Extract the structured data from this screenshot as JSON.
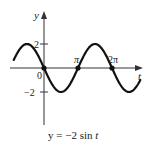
{
  "chart_data": {
    "type": "line",
    "title": "",
    "caption": "y = −2 sin t",
    "xlabel": "t",
    "ylabel": "y",
    "function": "y = -2 sin t",
    "x_ticks": [
      {
        "value": 0,
        "label": "0"
      },
      {
        "value": 3.14159,
        "label": "π"
      },
      {
        "value": 6.28319,
        "label": "2π"
      }
    ],
    "y_ticks": [
      {
        "value": 2,
        "label": "2"
      },
      {
        "value": -2,
        "label": "−2"
      }
    ],
    "xlim": [
      -3.1,
      9.0
    ],
    "ylim": [
      -4.8,
      4.7
    ],
    "grid": false,
    "legend": null,
    "marked_points": [
      {
        "x": 0,
        "y": 0
      },
      {
        "x": 3.14159,
        "y": 0
      },
      {
        "x": 6.28319,
        "y": 0
      }
    ],
    "series": [
      {
        "name": "y = -2 sin t",
        "x": [
          -2.8,
          -2.356,
          -1.571,
          -0.785,
          0,
          0.785,
          1.571,
          2.356,
          3.142,
          3.927,
          4.712,
          5.498,
          6.283,
          7.069,
          7.854,
          8.639,
          8.9
        ],
        "values": [
          0.67,
          1.41,
          2.0,
          1.41,
          0,
          -1.41,
          -2.0,
          -1.41,
          0,
          1.41,
          2.0,
          1.41,
          0,
          -1.41,
          -2.0,
          -1.41,
          -1.0
        ]
      }
    ],
    "t_range": [
      -2.8,
      8.9
    ],
    "amplitude": 2
  },
  "labels": {
    "y_axis": "y",
    "t_axis": "t",
    "origin": "0",
    "pi": "π",
    "two_pi": "2π",
    "y_pos2": "2",
    "y_neg2": "−2",
    "caption_prefix": "y = −2 sin ",
    "caption_var": "t"
  },
  "colors": {
    "curve": "#111111",
    "axes": "#333333",
    "text": "#222222",
    "background": "#ffffff"
  }
}
